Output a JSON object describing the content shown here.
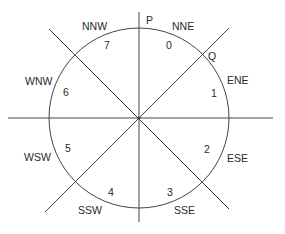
{
  "diagram": {
    "type": "compass-sector-diagram",
    "center": {
      "x": 139,
      "y": 118
    },
    "radius": 90,
    "points": [
      {
        "label": "P",
        "x": 146,
        "y": 24
      },
      {
        "label": "Q",
        "x": 208,
        "y": 59
      }
    ],
    "directions": [
      {
        "label": "NNE",
        "x": 172,
        "y": 30
      },
      {
        "label": "ENE",
        "x": 227,
        "y": 84
      },
      {
        "label": "ESE",
        "x": 227,
        "y": 162
      },
      {
        "label": "SSE",
        "x": 174,
        "y": 214
      },
      {
        "label": "SSW",
        "x": 78,
        "y": 214
      },
      {
        "label": "WSW",
        "x": 24,
        "y": 161
      },
      {
        "label": "WNW",
        "x": 25,
        "y": 85
      },
      {
        "label": "NNW",
        "x": 82,
        "y": 30
      }
    ],
    "sectors": [
      {
        "label": "0",
        "x": 166,
        "y": 49
      },
      {
        "label": "1",
        "x": 211,
        "y": 97
      },
      {
        "label": "2",
        "x": 204,
        "y": 153
      },
      {
        "label": "3",
        "x": 167,
        "y": 196
      },
      {
        "label": "4",
        "x": 108,
        "y": 196
      },
      {
        "label": "5",
        "x": 65,
        "y": 152
      },
      {
        "label": "6",
        "x": 63,
        "y": 96
      },
      {
        "label": "7",
        "x": 104,
        "y": 49
      }
    ]
  }
}
